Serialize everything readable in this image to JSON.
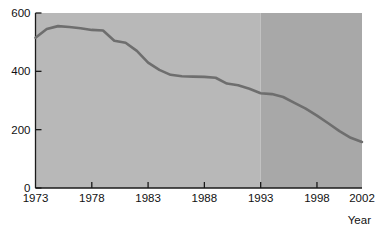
{
  "chart_data": {
    "type": "line",
    "title": "",
    "xlabel": "Year",
    "ylabel": "",
    "xlim": [
      1973,
      2002
    ],
    "ylim": [
      0,
      600
    ],
    "grid": false,
    "legend": null,
    "x_ticks": [
      1973,
      1978,
      1983,
      1988,
      1993,
      1998,
      2002
    ],
    "x_tick_labels": [
      "1973",
      "1978",
      "1983",
      "1988",
      "1993",
      "1998",
      "2002"
    ],
    "y_ticks": [
      0,
      200,
      400,
      600
    ],
    "y_tick_labels": [
      "0",
      "200",
      "400",
      "600"
    ],
    "series": [
      {
        "name": "value",
        "x": [
          1973,
          1974,
          1975,
          1976,
          1977,
          1978,
          1979,
          1980,
          1981,
          1982,
          1983,
          1984,
          1985,
          1986,
          1987,
          1988,
          1989,
          1990,
          1991,
          1992,
          1993,
          1994,
          1995,
          1996,
          1997,
          1998,
          1999,
          2000,
          2001,
          2002
        ],
        "values": [
          515,
          545,
          555,
          552,
          548,
          542,
          540,
          505,
          498,
          470,
          430,
          405,
          388,
          383,
          382,
          381,
          378,
          358,
          352,
          340,
          325,
          322,
          312,
          292,
          272,
          248,
          222,
          195,
          172,
          158
        ]
      }
    ],
    "shaded_regions": [
      {
        "name": "light-band",
        "x_start": 1973,
        "x_end": 1993,
        "color": "#b8b8b8"
      },
      {
        "name": "dark-band",
        "x_start": 1993,
        "x_end": 2002,
        "color": "#a8a8a8"
      }
    ],
    "colors": {
      "line": "#6e6e6e",
      "axis": "#1a1a1a",
      "plot_bg_light": "#b8b8b8",
      "plot_bg_dark": "#a8a8a8",
      "page_bg": "#ffffff",
      "text": "#111111"
    }
  }
}
